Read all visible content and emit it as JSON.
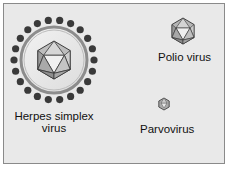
{
  "figure": {
    "background": "#e9e9e9",
    "border_color": "#8a8a8a",
    "viruses": [
      {
        "name": "Herpes simplex virus",
        "label_line1": "Herpes simplex",
        "label_line2": "virus",
        "type": "enveloped-icosahedral",
        "relative_size": "large"
      },
      {
        "name": "Polio virus",
        "label": "Polio virus",
        "type": "icosahedral",
        "relative_size": "medium"
      },
      {
        "name": "Parvovirus",
        "label": "Parvovirus",
        "type": "icosahedral",
        "relative_size": "small"
      }
    ]
  }
}
